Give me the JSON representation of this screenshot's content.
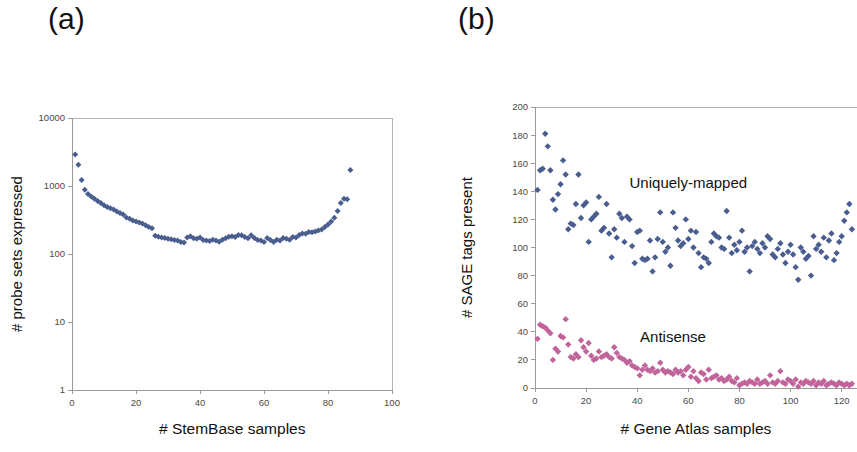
{
  "figure": {
    "panel_a_tag": "(a)",
    "panel_b_tag": "(b)"
  },
  "chart_data": [
    {
      "id": "panel_a",
      "type": "scatter",
      "title": "(a)",
      "xlabel": "# StemBase samples",
      "ylabel": "# probe sets expressed",
      "xlim": [
        0,
        100
      ],
      "ylim": [
        1,
        10000
      ],
      "yscale": "log",
      "xticks": [
        0,
        20,
        40,
        60,
        80,
        100
      ],
      "yticks": [
        1,
        10,
        100,
        1000,
        10000
      ],
      "ytick_labels": [
        "1",
        "10",
        "100",
        "1000",
        "10000"
      ],
      "grid": false,
      "legend": "none",
      "marker": "diamond",
      "marker_color": "#4a5d8f",
      "series": [
        {
          "name": "probe sets expressed",
          "color": "#4a5d8f",
          "x": [
            1,
            2,
            3,
            4,
            5,
            6,
            7,
            8,
            9,
            10,
            11,
            12,
            13,
            14,
            15,
            16,
            17,
            18,
            19,
            20,
            21,
            22,
            23,
            24,
            25,
            26,
            27,
            28,
            29,
            30,
            31,
            32,
            33,
            34,
            35,
            36,
            37,
            38,
            39,
            40,
            41,
            42,
            43,
            44,
            45,
            46,
            47,
            48,
            49,
            50,
            51,
            52,
            53,
            54,
            55,
            56,
            57,
            58,
            59,
            60,
            61,
            62,
            63,
            64,
            65,
            66,
            67,
            68,
            69,
            70,
            71,
            72,
            73,
            74,
            75,
            76,
            77,
            78,
            79,
            80,
            81,
            82,
            83,
            84,
            85,
            86,
            87
          ],
          "y": [
            2900,
            2050,
            1230,
            880,
            760,
            700,
            650,
            600,
            560,
            520,
            490,
            470,
            450,
            420,
            400,
            380,
            345,
            330,
            310,
            300,
            290,
            280,
            265,
            250,
            240,
            185,
            180,
            175,
            172,
            168,
            165,
            160,
            158,
            150,
            148,
            175,
            182,
            170,
            168,
            175,
            160,
            158,
            155,
            162,
            158,
            152,
            162,
            170,
            180,
            182,
            178,
            190,
            188,
            178,
            170,
            188,
            172,
            160,
            158,
            150,
            172,
            160,
            150,
            162,
            158,
            172,
            168,
            162,
            178,
            175,
            190,
            200,
            198,
            210,
            208,
            215,
            222,
            230,
            250,
            272,
            300,
            340,
            430,
            560,
            650,
            640,
            1720
          ]
        }
      ]
    },
    {
      "id": "panel_b",
      "type": "scatter",
      "title": "(b)",
      "xlabel": "# Gene Atlas samples",
      "ylabel": "# SAGE tags present",
      "xlim": [
        0,
        126
      ],
      "ylim": [
        0,
        200
      ],
      "yscale": "linear",
      "xticks": [
        0,
        20,
        40,
        60,
        80,
        100,
        120
      ],
      "yticks": [
        0,
        20,
        40,
        60,
        80,
        100,
        120,
        140,
        160,
        180,
        200
      ],
      "grid": false,
      "legend": "inline-annotations",
      "annotations": [
        {
          "text": "Uniquely-mapped",
          "x": 60,
          "y": 142
        },
        {
          "text": "Antisense",
          "x": 54,
          "y": 33
        }
      ],
      "series": [
        {
          "name": "Uniquely-mapped",
          "color": "#4a5d8f",
          "marker": "diamond",
          "x": [
            1,
            2,
            3,
            4,
            5,
            6,
            7,
            8,
            9,
            10,
            11,
            12,
            13,
            14,
            15,
            16,
            17,
            18,
            19,
            20,
            21,
            22,
            23,
            24,
            25,
            26,
            27,
            28,
            29,
            30,
            31,
            32,
            33,
            34,
            35,
            36,
            37,
            38,
            39,
            40,
            41,
            42,
            43,
            44,
            45,
            46,
            47,
            48,
            49,
            50,
            51,
            52,
            53,
            54,
            55,
            56,
            57,
            58,
            59,
            60,
            61,
            62,
            63,
            64,
            65,
            66,
            67,
            68,
            69,
            70,
            71,
            72,
            73,
            74,
            75,
            76,
            77,
            78,
            79,
            80,
            81,
            82,
            83,
            84,
            85,
            86,
            87,
            88,
            89,
            90,
            91,
            92,
            93,
            94,
            95,
            96,
            97,
            98,
            99,
            100,
            101,
            102,
            103,
            104,
            105,
            106,
            107,
            108,
            109,
            110,
            111,
            112,
            113,
            114,
            115,
            116,
            117,
            118,
            119,
            120,
            121,
            122,
            123,
            124
          ],
          "y": [
            141,
            155,
            156,
            181,
            172,
            155,
            134,
            127,
            138,
            145,
            162,
            152,
            113,
            117,
            116,
            131,
            152,
            121,
            130,
            132,
            104,
            120,
            122,
            124,
            136,
            112,
            114,
            131,
            110,
            93,
            113,
            107,
            124,
            121,
            104,
            122,
            120,
            101,
            89,
            111,
            112,
            92,
            91,
            92,
            105,
            83,
            93,
            106,
            125,
            104,
            97,
            100,
            87,
            125,
            114,
            105,
            101,
            103,
            120,
            106,
            112,
            100,
            111,
            96,
            86,
            93,
            92,
            89,
            104,
            110,
            108,
            107,
            100,
            99,
            126,
            107,
            96,
            102,
            98,
            104,
            112,
            97,
            100,
            83,
            101,
            104,
            99,
            96,
            103,
            100,
            108,
            106,
            95,
            93,
            99,
            103,
            95,
            89,
            97,
            102,
            95,
            86,
            77,
            100,
            97,
            92,
            94,
            80,
            108,
            99,
            102,
            97,
            107,
            93,
            105,
            110,
            91,
            96,
            104,
            108,
            119,
            125,
            131,
            113
          ]
        },
        {
          "name": "Antisense",
          "color": "#c0649b",
          "marker": "diamond",
          "x": [
            1,
            2,
            3,
            4,
            5,
            6,
            7,
            8,
            9,
            10,
            11,
            12,
            13,
            14,
            15,
            16,
            17,
            18,
            19,
            20,
            21,
            22,
            23,
            24,
            25,
            26,
            27,
            28,
            29,
            30,
            31,
            32,
            33,
            34,
            35,
            36,
            37,
            38,
            39,
            40,
            41,
            42,
            43,
            44,
            45,
            46,
            47,
            48,
            49,
            50,
            51,
            52,
            53,
            54,
            55,
            56,
            57,
            58,
            59,
            60,
            61,
            62,
            63,
            64,
            65,
            66,
            67,
            68,
            69,
            70,
            71,
            72,
            73,
            74,
            75,
            76,
            77,
            78,
            79,
            80,
            81,
            82,
            83,
            84,
            85,
            86,
            87,
            88,
            89,
            90,
            91,
            92,
            93,
            94,
            95,
            96,
            97,
            98,
            99,
            100,
            101,
            102,
            103,
            104,
            105,
            106,
            107,
            108,
            109,
            110,
            111,
            112,
            113,
            114,
            115,
            116,
            117,
            118,
            119,
            120,
            121,
            122,
            123,
            124
          ],
          "y": [
            35,
            45,
            44,
            43,
            41,
            39,
            20,
            28,
            26,
            37,
            36,
            49,
            31,
            22,
            21,
            24,
            22,
            34,
            29,
            26,
            32,
            23,
            20,
            21,
            26,
            22,
            23,
            24,
            22,
            21,
            29,
            25,
            22,
            21,
            20,
            18,
            19,
            16,
            15,
            14,
            9,
            13,
            16,
            13,
            12,
            14,
            11,
            12,
            18,
            13,
            11,
            12,
            11,
            10,
            13,
            11,
            12,
            9,
            13,
            15,
            8,
            12,
            7,
            5,
            11,
            10,
            6,
            13,
            7,
            8,
            9,
            6,
            7,
            5,
            6,
            8,
            5,
            4,
            7,
            2,
            3,
            4,
            3,
            5,
            4,
            3,
            6,
            3,
            4,
            5,
            3,
            9,
            4,
            3,
            5,
            12,
            4,
            3,
            6,
            5,
            3,
            6,
            1,
            4,
            3,
            5,
            4,
            3,
            5,
            2,
            4,
            3,
            5,
            2,
            3,
            4,
            3,
            2,
            4,
            3,
            2,
            3,
            2,
            3
          ]
        }
      ]
    }
  ]
}
